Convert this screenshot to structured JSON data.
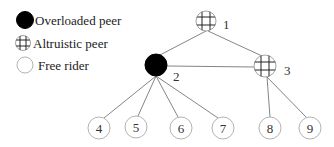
{
  "legend": {
    "items": [
      {
        "type": "overloaded",
        "label": "Overloaded peer"
      },
      {
        "type": "altruistic",
        "label": "Altruistic peer"
      },
      {
        "type": "free",
        "label": "Free rider"
      }
    ]
  },
  "nodes": [
    {
      "id": "1",
      "type": "altruistic"
    },
    {
      "id": "2",
      "type": "overloaded"
    },
    {
      "id": "3",
      "type": "altruistic"
    },
    {
      "id": "4",
      "type": "free"
    },
    {
      "id": "5",
      "type": "free"
    },
    {
      "id": "6",
      "type": "free"
    },
    {
      "id": "7",
      "type": "free"
    },
    {
      "id": "8",
      "type": "free"
    },
    {
      "id": "9",
      "type": "free"
    }
  ],
  "edges": [
    [
      "1",
      "2"
    ],
    [
      "1",
      "3"
    ],
    [
      "2",
      "3"
    ],
    [
      "2",
      "4"
    ],
    [
      "2",
      "5"
    ],
    [
      "2",
      "6"
    ],
    [
      "2",
      "7"
    ],
    [
      "3",
      "8"
    ],
    [
      "3",
      "9"
    ]
  ],
  "colors": {
    "overloaded": "#000000",
    "altruistic_hatch": "#222222",
    "free_stroke": "#aaaaaa",
    "edge": "#777777"
  }
}
